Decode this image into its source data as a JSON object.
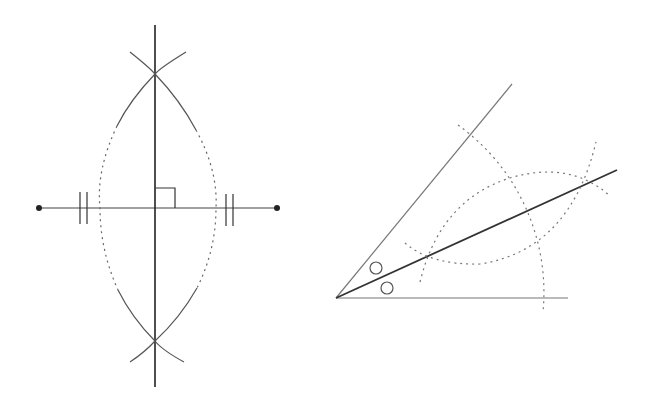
{
  "figures": [
    {
      "name": "Perpendicular bisector construction",
      "segment": {
        "a": [
          39,
          208
        ],
        "b": [
          277,
          208
        ]
      },
      "bisector": {
        "x": 155,
        "y1": 25,
        "y2": 387
      },
      "intersections": [
        [
          155,
          74
        ],
        [
          155,
          341
        ]
      ],
      "equal_marks": "double ticks",
      "right_angle_marker": true
    },
    {
      "name": "Angle bisector construction",
      "vertex": [
        336,
        298
      ],
      "ray_lower_end": [
        568,
        298
      ],
      "ray_upper_end": [
        512,
        84
      ],
      "bisector_end": [
        617,
        170
      ],
      "equal_angle_marks": "circles"
    }
  ],
  "colors": {
    "line": "#555555",
    "bold_line": "#333333",
    "dotted": "#777777",
    "point": "#222222"
  }
}
